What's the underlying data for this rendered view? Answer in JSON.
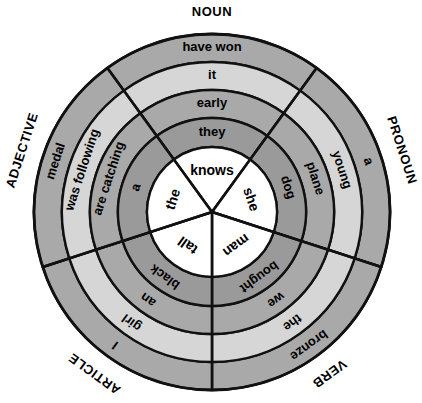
{
  "figure": {
    "center_x": 212,
    "center_y": 212,
    "outer_radius": 178,
    "inner_radius": 65,
    "ring_boundaries": [
      178,
      150,
      122,
      94,
      65
    ],
    "sector_count": 5,
    "sector_span_degrees": 72,
    "background_color": "#ffffff",
    "line_color": "#111111"
  },
  "colors": {
    "ring_1": "#a9a9a9",
    "ring_2": "#d6d6d6",
    "ring_3": "#a9a9a9",
    "ring_4": "#9a9a9a",
    "inner": "#ffffff",
    "text": "#000000"
  },
  "sectors": [
    {
      "label": "NOUN",
      "label_angle_deg": -90,
      "center_angle_deg": -90,
      "rings": [
        {
          "ring": 1,
          "word": "have won",
          "shade": "ring_1"
        },
        {
          "ring": 2,
          "word": "it",
          "shade": "ring_2"
        },
        {
          "ring": 3,
          "word": "early",
          "shade": "ring_3"
        },
        {
          "ring": 4,
          "word": "they",
          "shade": "ring_4"
        },
        {
          "ring": 5,
          "word": "knows",
          "shade": "inner"
        }
      ]
    },
    {
      "label": "PRONOUN",
      "label_angle_deg": -18,
      "center_angle_deg": -18,
      "rings": [
        {
          "ring": 1,
          "word": "a",
          "shade": "ring_1"
        },
        {
          "ring": 2,
          "word": "young",
          "shade": "ring_2"
        },
        {
          "ring": 3,
          "word": "plane",
          "shade": "ring_3"
        },
        {
          "ring": 4,
          "word": "dog",
          "shade": "ring_4"
        },
        {
          "ring": 5,
          "word": "she",
          "shade": "inner"
        }
      ]
    },
    {
      "label": "VERB",
      "label_angle_deg": 54,
      "center_angle_deg": 54,
      "rings": [
        {
          "ring": 1,
          "word": "bronze",
          "shade": "ring_1"
        },
        {
          "ring": 2,
          "word": "the",
          "shade": "ring_2"
        },
        {
          "ring": 3,
          "word": "we",
          "shade": "ring_3"
        },
        {
          "ring": 4,
          "word": "bought",
          "shade": "ring_4"
        },
        {
          "ring": 5,
          "word": "man",
          "shade": "inner"
        }
      ]
    },
    {
      "label": "ARTICLE",
      "label_angle_deg": 126,
      "center_angle_deg": 126,
      "rings": [
        {
          "ring": 1,
          "word": "I",
          "shade": "ring_1"
        },
        {
          "ring": 2,
          "word": "girl",
          "shade": "ring_2"
        },
        {
          "ring": 3,
          "word": "an",
          "shade": "ring_3"
        },
        {
          "ring": 4,
          "word": "black",
          "shade": "ring_4"
        },
        {
          "ring": 5,
          "word": "tall",
          "shade": "inner"
        }
      ]
    },
    {
      "label": "ADJECTIVE",
      "label_angle_deg": 198,
      "center_angle_deg": 198,
      "rings": [
        {
          "ring": 1,
          "word": "medal",
          "shade": "ring_1"
        },
        {
          "ring": 2,
          "word": "was following",
          "shade": "ring_2"
        },
        {
          "ring": 3,
          "word": "are catching",
          "shade": "ring_3"
        },
        {
          "ring": 4,
          "word": "a",
          "shade": "ring_4"
        },
        {
          "ring": 5,
          "word": "the",
          "shade": "inner"
        }
      ]
    }
  ],
  "font_sizes": {
    "ring_1": 13,
    "ring_2": 13,
    "ring_3": 13,
    "ring_4": 13,
    "inner": 14,
    "pos_label": 13
  }
}
